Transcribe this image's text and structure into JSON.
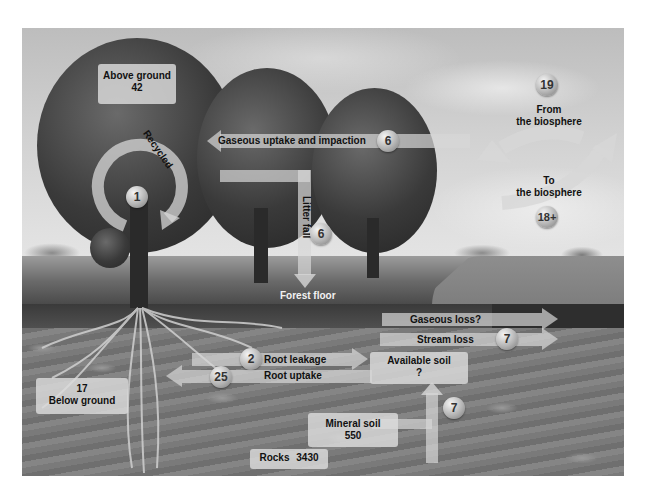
{
  "diagram": {
    "pools": {
      "above_ground": {
        "label": "Above ground",
        "value": "42"
      },
      "below_ground": {
        "label": "Below ground",
        "value": "17"
      },
      "forest_floor": {
        "label": "Forest floor"
      },
      "available_soil": {
        "label": "Available soil",
        "value": "?"
      },
      "mineral_soil": {
        "label": "Mineral soil",
        "value": "550"
      },
      "rocks": {
        "label": "Rocks",
        "value": "3430"
      }
    },
    "flows": {
      "recycled": {
        "label": "Recycled",
        "value": "1"
      },
      "gaseous_uptake": {
        "label": "Gaseous uptake and impaction",
        "value": "6"
      },
      "litter_fall": {
        "label": "Litter fall",
        "value": "6"
      },
      "from_biosphere": {
        "label_line1": "From",
        "label_line2": "the biosphere",
        "value": "19"
      },
      "to_biosphere": {
        "label_line1": "To",
        "label_line2": "the biosphere",
        "value": "18+"
      },
      "gaseous_loss": {
        "label": "Gaseous loss?"
      },
      "stream_loss": {
        "label": "Stream loss",
        "value": "7"
      },
      "root_leakage": {
        "label": "Root leakage",
        "value": "2"
      },
      "root_uptake": {
        "label": "Root uptake",
        "value": "25"
      },
      "weathering": {
        "value": "7"
      }
    }
  },
  "colors": {
    "label_box": "#dcdcdc",
    "text": "#111111",
    "arrow": "#d7d7d7",
    "badge": "#b5b5b5"
  }
}
